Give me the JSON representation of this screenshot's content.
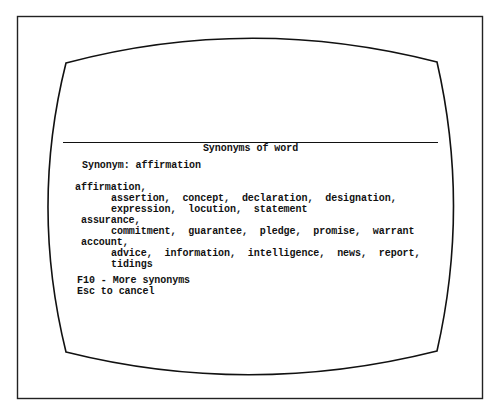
{
  "dialog": {
    "title": "Synonyms of word",
    "prompt_label": "Synonym:",
    "prompt_value": "affirmation"
  },
  "groups": [
    {
      "headword": "affirmation,",
      "lines": [
        "assertion,  concept,  declaration,  designation,",
        "expression,  locution,  statement"
      ]
    },
    {
      "headword": "assurance,",
      "lines": [
        "commitment,  guarantee,  pledge,  promise,  warrant"
      ]
    },
    {
      "headword": "account,",
      "lines": [
        "advice,  information,  intelligence,  news,  report,",
        "tidings"
      ]
    }
  ],
  "footer": {
    "more": "F10 - More synonyms",
    "cancel": "Esc to cancel"
  },
  "colors": {
    "ink": "#111111",
    "background": "#ffffff"
  }
}
